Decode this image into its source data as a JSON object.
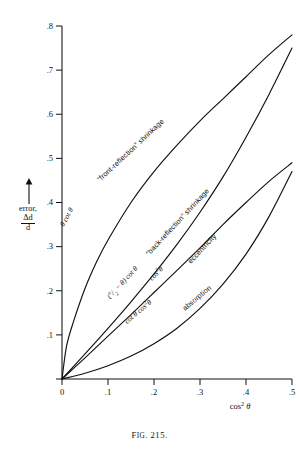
{
  "figure": {
    "caption_prefix": "F",
    "caption_smallcaps": "IG",
    "caption_rest": ". 215."
  },
  "axes": {
    "x_title": "cos² θ",
    "y_label_word": "error,",
    "y_frac_num": "Δd",
    "y_frac_den": "d",
    "x_ticks": [
      "0",
      ".1",
      ".2",
      ".3",
      ".4",
      ".5"
    ],
    "y_ticks": [
      ".1",
      ".2",
      ".3",
      ".4",
      ".5",
      ".6",
      ".7",
      ".8"
    ],
    "xlim": [
      0,
      0.5
    ],
    "ylim": [
      0,
      0.8
    ]
  },
  "curve_labels": {
    "front_reflection": "“front-reflection” shrinkage",
    "front_formula": "θ cot θ",
    "back_reflection": "“back-reflection” shrinkage",
    "back_formula": "(π/2 − θ) cot θ",
    "eccentricity": "eccentricity",
    "eccentricity_formula": "cos²θ",
    "absorption": "absorption",
    "absorption_formula": "cot θ cos²θ"
  },
  "chart_data": {
    "type": "line",
    "title": "Fig. 215.",
    "xlabel": "cos² θ",
    "ylabel": "error, Δd/d",
    "xlim": [
      0,
      0.5
    ],
    "ylim": [
      0,
      0.8
    ],
    "x_ticks": [
      0,
      0.1,
      0.2,
      0.3,
      0.4,
      0.5
    ],
    "y_ticks": [
      0.1,
      0.2,
      0.3,
      0.4,
      0.5,
      0.6,
      0.7,
      0.8
    ],
    "grid": false,
    "legend": "inline-curve-labels",
    "series": [
      {
        "name": "“front-reflection” shrinkage",
        "formula": "θ cot θ",
        "x": [
          0,
          0.01,
          0.025,
          0.05,
          0.075,
          0.1,
          0.15,
          0.2,
          0.25,
          0.3,
          0.35,
          0.4,
          0.45,
          0.5
        ],
        "y": [
          0,
          0.075,
          0.13,
          0.205,
          0.265,
          0.315,
          0.4,
          0.47,
          0.53,
          0.585,
          0.635,
          0.685,
          0.735,
          0.78
        ]
      },
      {
        "name": "“back-reflection” shrinkage",
        "formula": "(π/2 − θ) cot θ",
        "x": [
          0,
          0.05,
          0.1,
          0.15,
          0.2,
          0.25,
          0.3,
          0.35,
          0.4,
          0.45,
          0.5
        ],
        "y": [
          0,
          0.057,
          0.115,
          0.175,
          0.238,
          0.305,
          0.378,
          0.458,
          0.548,
          0.645,
          0.75
        ]
      },
      {
        "name": "eccentricity",
        "formula": "cos²θ",
        "x": [
          0,
          0.05,
          0.1,
          0.15,
          0.2,
          0.25,
          0.3,
          0.35,
          0.4,
          0.45,
          0.5
        ],
        "y": [
          0,
          0.048,
          0.097,
          0.146,
          0.196,
          0.246,
          0.297,
          0.35,
          0.4,
          0.448,
          0.49
        ]
      },
      {
        "name": "absorption",
        "formula": "cot θ cos²θ",
        "x": [
          0,
          0.05,
          0.1,
          0.15,
          0.2,
          0.25,
          0.3,
          0.35,
          0.4,
          0.45,
          0.5
        ],
        "y": [
          0,
          0.013,
          0.03,
          0.052,
          0.08,
          0.115,
          0.16,
          0.215,
          0.283,
          0.368,
          0.47
        ]
      }
    ]
  }
}
